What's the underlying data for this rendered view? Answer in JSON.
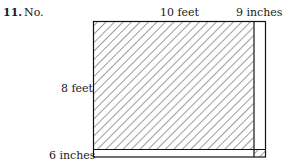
{
  "problem": {
    "number": "11.",
    "answer": "No."
  },
  "diagram": {
    "labels": {
      "top_width": "10 feet",
      "top_extra": "9 inches",
      "left_height": "8 feet",
      "bottom_extra": "6 inches"
    },
    "main_rect": {
      "width_ft": 10,
      "height_ft": 8,
      "hatched": true
    },
    "extension_right_in": 9,
    "extension_bottom_in": 6,
    "corner_square_hatched": true
  }
}
